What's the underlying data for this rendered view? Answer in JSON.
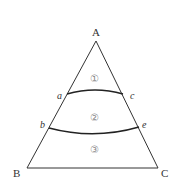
{
  "diagram": {
    "title": "",
    "vertices": [
      {
        "id": "A",
        "label": "A"
      },
      {
        "id": "B",
        "label": "B"
      },
      {
        "id": "C",
        "label": "C"
      }
    ],
    "points": [
      {
        "id": "a",
        "label": "a"
      },
      {
        "id": "c",
        "label": "c"
      },
      {
        "id": "b",
        "label": "b"
      },
      {
        "id": "e",
        "label": "e"
      }
    ],
    "regions": [
      {
        "id": "1",
        "label": "①"
      },
      {
        "id": "2",
        "label": "②"
      },
      {
        "id": "3",
        "label": "③"
      }
    ],
    "colors": {
      "line": "#333333",
      "region_label": "#888888"
    }
  }
}
